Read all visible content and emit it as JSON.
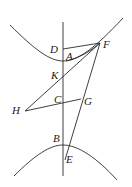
{
  "figure": {
    "labels": {
      "D": "D",
      "A": "A",
      "F": "F",
      "K": "K",
      "C": "C",
      "G": "G",
      "H": "H",
      "B": "B",
      "E": "E"
    },
    "stroke_color": "#2a2a2a",
    "text_color": "#1a1a1a"
  }
}
